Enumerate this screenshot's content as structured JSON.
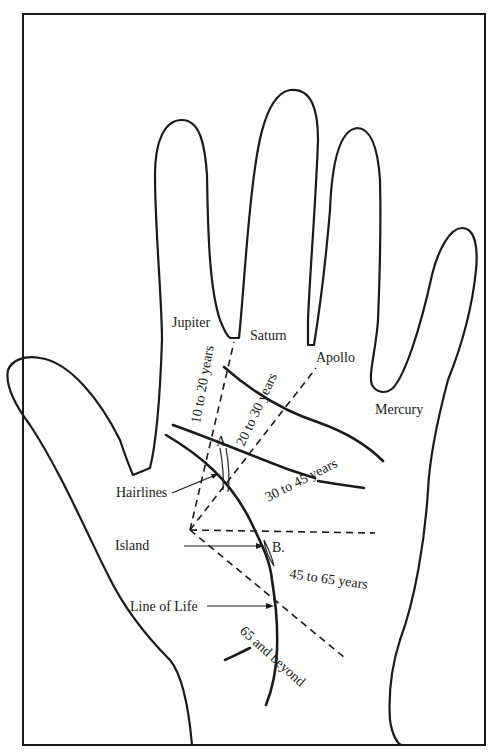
{
  "figure": {
    "fingers": {
      "jupiter": "Jupiter",
      "saturn": "Saturn",
      "apollo": "Apollo",
      "mercury": "Mercury"
    },
    "age_ranges": {
      "r1": "10 to 20 years",
      "r2": "20 to 30 years",
      "r3": "30 to 45 years",
      "r4": "45 to 65 years",
      "r5": "65 and beyond"
    },
    "markers": {
      "a": "A.",
      "b": "B."
    },
    "callouts": {
      "hairlines": "Hairlines",
      "island": "Island",
      "line_of_life": "Line of Life"
    },
    "colors": {
      "ink": "#1a1a1a",
      "paper": "#ffffff"
    }
  }
}
